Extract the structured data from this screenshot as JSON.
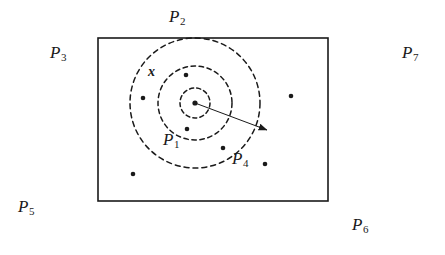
{
  "figure": {
    "title_visible": false,
    "background_color": "#ffffff",
    "stroke_color": "#1a1a1a",
    "boundary_rect": {
      "x": 98,
      "y": 38,
      "width": 230,
      "height": 163,
      "stroke_width": 1.6,
      "fill": "none"
    },
    "circles": [
      {
        "name": "inner-circle",
        "cx": 195,
        "cy": 103,
        "r": 15,
        "dash": "4,3.2"
      },
      {
        "name": "middle-circle",
        "cx": 195,
        "cy": 103,
        "r": 37,
        "dash": "4.5,3.6"
      },
      {
        "name": "outer-circle",
        "cx": 195,
        "cy": 103,
        "r": 65,
        "dash": "5,4"
      }
    ],
    "radius_arrow": {
      "name": "radius-arrow",
      "x1": 195,
      "y1": 103,
      "x2": 267,
      "y2": 130,
      "arrowhead": true
    },
    "points": [
      {
        "name": "center-point",
        "cx": 195,
        "cy": 103,
        "r": 2.6
      },
      {
        "name": "data-point-1",
        "cx": 186,
        "cy": 75,
        "r": 2.3
      },
      {
        "name": "data-point-2",
        "cx": 143,
        "cy": 98,
        "r": 2.3
      },
      {
        "name": "data-point-3",
        "cx": 187,
        "cy": 129,
        "r": 2.3
      },
      {
        "name": "data-point-4",
        "cx": 223,
        "cy": 148,
        "r": 2.3
      },
      {
        "name": "data-point-5",
        "cx": 265,
        "cy": 164,
        "r": 2.3
      },
      {
        "name": "data-point-6",
        "cx": 133,
        "cy": 174,
        "r": 2.3
      },
      {
        "name": "data-point-7",
        "cx": 291,
        "cy": 96,
        "r": 2.3
      }
    ]
  },
  "labels": {
    "x_marker": {
      "text": "x",
      "x": 148,
      "y": 65
    },
    "partitions": [
      {
        "key": "P2",
        "base": "P",
        "sub": "2",
        "x": 169,
        "y": 8,
        "name": "partition-label-p2"
      },
      {
        "key": "P3",
        "base": "P",
        "sub": "3",
        "x": 50,
        "y": 44,
        "name": "partition-label-p3"
      },
      {
        "key": "P7",
        "base": "P",
        "sub": "7",
        "x": 402,
        "y": 44,
        "name": "partition-label-p7"
      },
      {
        "key": "P1",
        "base": "P",
        "sub": "1",
        "x": 163,
        "y": 131,
        "name": "partition-label-p1"
      },
      {
        "key": "P4",
        "base": "P",
        "sub": "4",
        "x": 232,
        "y": 150,
        "name": "partition-label-p4"
      },
      {
        "key": "P5",
        "base": "P",
        "sub": "5",
        "x": 18,
        "y": 198,
        "name": "partition-label-p5"
      },
      {
        "key": "P6",
        "base": "P",
        "sub": "6",
        "x": 352,
        "y": 216,
        "name": "partition-label-p6"
      }
    ]
  }
}
